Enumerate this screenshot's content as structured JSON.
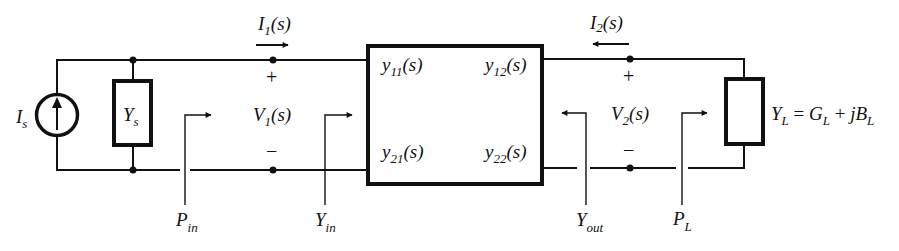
{
  "diagram": {
    "type": "two-port admittance network",
    "source": {
      "symbol": "I",
      "sub": "s"
    },
    "source_admittance": {
      "symbol": "Y",
      "sub": "s"
    },
    "port1_current": {
      "symbol": "I",
      "sub": "1",
      "arg": "(s)"
    },
    "port2_current": {
      "symbol": "I",
      "sub": "2",
      "arg": "(s)"
    },
    "port1_voltage": {
      "symbol": "V",
      "sub": "1",
      "arg": "(s)",
      "plus": "+",
      "minus": "−"
    },
    "port2_voltage": {
      "symbol": "V",
      "sub": "2",
      "arg": "(s)",
      "plus": "+",
      "minus": "−"
    },
    "two_port": {
      "y11": {
        "symbol": "y",
        "sub": "11",
        "arg": "(s)"
      },
      "y12": {
        "symbol": "y",
        "sub": "12",
        "arg": "(s)"
      },
      "y21": {
        "symbol": "y",
        "sub": "21",
        "arg": "(s)"
      },
      "y22": {
        "symbol": "y",
        "sub": "22",
        "arg": "(s)"
      }
    },
    "load": {
      "symbol": "Y",
      "sub": "L",
      "eq": " = ",
      "g": "G",
      "g_sub": "L",
      "plus": " + ",
      "jb": "jB",
      "b_sub": "L"
    },
    "p_in": {
      "symbol": "P",
      "sub": "in"
    },
    "y_in": {
      "symbol": "Y",
      "sub": "in"
    },
    "y_out": {
      "symbol": "Y",
      "sub": "out"
    },
    "p_l": {
      "symbol": "P",
      "sub": "L"
    },
    "colors": {
      "ink": "#111111",
      "background": "#ffffff"
    }
  }
}
